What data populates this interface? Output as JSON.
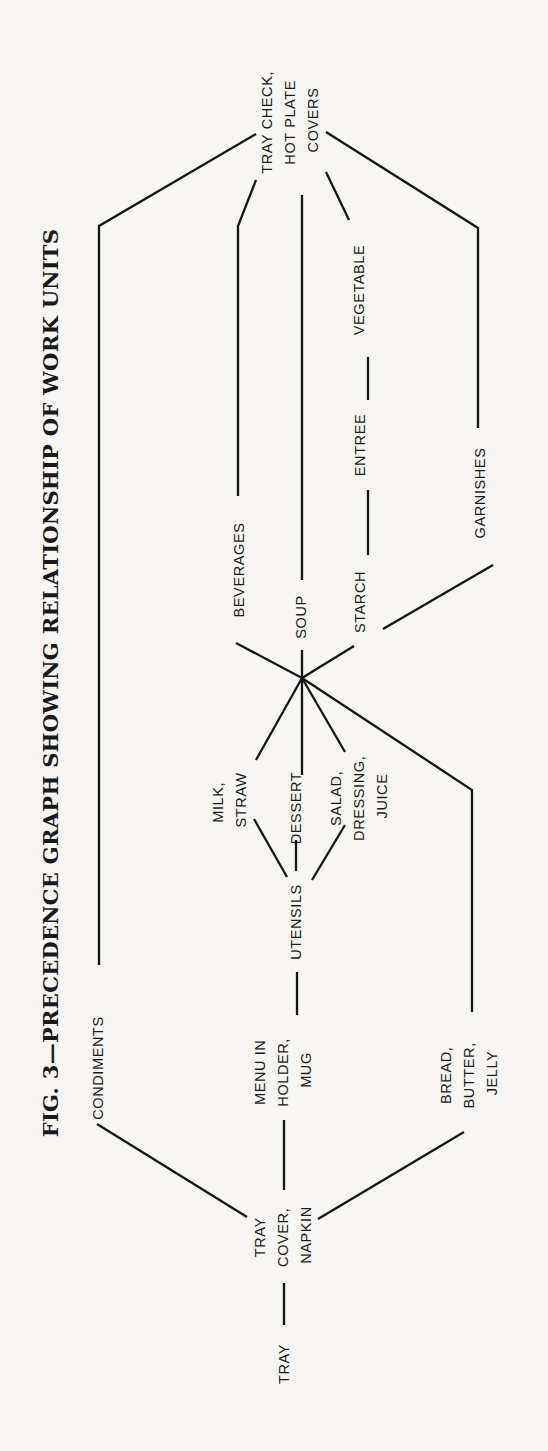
{
  "title": "FIG. 3—PRECEDENCE GRAPH SHOWING RELATIONSHIP OF WORK UNITS",
  "nodes": {
    "tray": {
      "lines": [
        "TRAY"
      ]
    },
    "tray_cover_napkin": {
      "lines": [
        "TRAY",
        "COVER,",
        "NAPKIN"
      ]
    },
    "condiments": {
      "lines": [
        "CONDIMENTS"
      ]
    },
    "menu_holder_mug": {
      "lines": [
        "MENU IN",
        "HOLDER,",
        "MUG"
      ]
    },
    "bread_butter_jelly": {
      "lines": [
        "BREAD,",
        "BUTTER,",
        "JELLY"
      ]
    },
    "utensils": {
      "lines": [
        "UTENSILS"
      ]
    },
    "milk_straw": {
      "lines": [
        "MILK,",
        "STRAW"
      ]
    },
    "dessert": {
      "lines": [
        "DESSERT"
      ]
    },
    "salad_dressing_juice": {
      "lines": [
        "SALAD,",
        "DRESSING,",
        "JUICE"
      ]
    },
    "beverages": {
      "lines": [
        "BEVERAGES"
      ]
    },
    "soup": {
      "lines": [
        "SOUP"
      ]
    },
    "starch": {
      "lines": [
        "STARCH"
      ]
    },
    "entree": {
      "lines": [
        "ENTREE"
      ]
    },
    "vegetable": {
      "lines": [
        "VEGETABLE"
      ]
    },
    "garnishes": {
      "lines": [
        "GARNISHES"
      ]
    },
    "tray_check_covers": {
      "lines": [
        "TRAY CHECK,",
        "HOT PLATE",
        "COVERS"
      ]
    }
  },
  "edges": [
    [
      "TRAY",
      "TRAY, COVER, NAPKIN"
    ],
    [
      "TRAY, COVER, NAPKIN",
      "CONDIMENTS"
    ],
    [
      "TRAY, COVER, NAPKIN",
      "MENU IN HOLDER, MUG"
    ],
    [
      "TRAY, COVER, NAPKIN",
      "BREAD, BUTTER, JELLY"
    ],
    [
      "CONDIMENTS",
      "TRAY CHECK, HOT PLATE COVERS"
    ],
    [
      "MENU IN HOLDER, MUG",
      "UTENSILS"
    ],
    [
      "UTENSILS",
      "MILK, STRAW"
    ],
    [
      "UTENSILS",
      "DESSERT"
    ],
    [
      "UTENSILS",
      "SALAD, DRESSING, JUICE"
    ],
    [
      "MILK, STRAW",
      "HUB"
    ],
    [
      "DESSERT",
      "HUB"
    ],
    [
      "SALAD, DRESSING, JUICE",
      "HUB"
    ],
    [
      "BREAD, BUTTER, JELLY",
      "HUB"
    ],
    [
      "HUB",
      "BEVERAGES"
    ],
    [
      "HUB",
      "SOUP"
    ],
    [
      "HUB",
      "STARCH"
    ],
    [
      "STARCH",
      "ENTREE"
    ],
    [
      "ENTREE",
      "VEGETABLE"
    ],
    [
      "STARCH",
      "GARNISHES"
    ],
    [
      "BEVERAGES",
      "TRAY CHECK, HOT PLATE COVERS"
    ],
    [
      "SOUP",
      "TRAY CHECK, HOT PLATE COVERS"
    ],
    [
      "VEGETABLE",
      "TRAY CHECK, HOT PLATE COVERS"
    ],
    [
      "GARNISHES",
      "TRAY CHECK, HOT PLATE COVERS"
    ]
  ],
  "colors": {
    "ink": "#141414",
    "paper": "#f7f6f3"
  }
}
